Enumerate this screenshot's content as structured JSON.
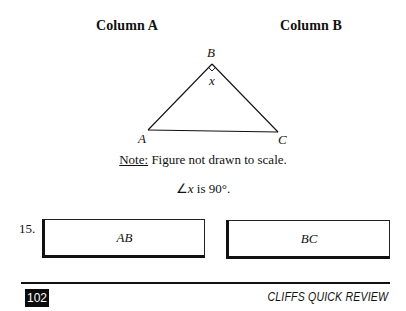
{
  "columns": {
    "a_label": "Column A",
    "b_label": "Column B"
  },
  "figure": {
    "vertices": {
      "A": {
        "label": "A"
      },
      "B": {
        "label": "B"
      },
      "C": {
        "label": "C"
      }
    },
    "angle_label": "x",
    "right_angle_marker": "right-angle-icon",
    "note_prefix": "Note:",
    "note_text": " Figure not drawn to scale."
  },
  "given": {
    "angle_symbol": "∠",
    "variable": "x",
    "rest": " is 90°."
  },
  "question": {
    "number": "15.",
    "column_a_value": "AB",
    "column_b_value": "BC"
  },
  "footer": {
    "page_number": "102",
    "title": "CLIFFS QUICK REVIEW"
  }
}
